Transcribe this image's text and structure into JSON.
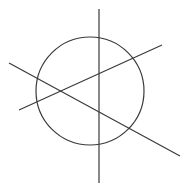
{
  "diagram": {
    "width": 189,
    "height": 190,
    "stroke_color": "#3a3a3a",
    "stroke_width": 1.2,
    "background": "#ffffff",
    "circle": {
      "cx": 90,
      "cy": 91,
      "r": 54
    },
    "lines": [
      {
        "name": "vertical-line",
        "x1": 99,
        "y1": 9,
        "x2": 99,
        "y2": 183
      },
      {
        "name": "ascending-line",
        "x1": 19,
        "y1": 110,
        "x2": 162,
        "y2": 45
      },
      {
        "name": "descending-line",
        "x1": 9,
        "y1": 63,
        "x2": 180,
        "y2": 156
      }
    ]
  }
}
